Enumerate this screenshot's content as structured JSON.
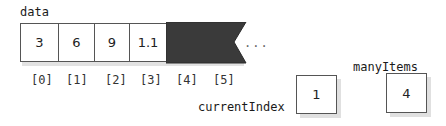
{
  "array": {
    "name": "data",
    "cells": [
      {
        "value": "3",
        "index_label": "[0]"
      },
      {
        "value": "6",
        "index_label": "[1]"
      },
      {
        "value": "9",
        "index_label": "[2]"
      },
      {
        "value": "1.1",
        "index_label": "[3]"
      },
      {
        "value": "",
        "index_label": "[4]"
      },
      {
        "value": "",
        "index_label": "[5]"
      }
    ],
    "continuation": "...",
    "unused_fill_color": "#3a3a3a"
  },
  "variables": {
    "current_index": {
      "name": "currentIndex",
      "value": "1"
    },
    "many_items": {
      "name": "manyItems",
      "value": "4"
    }
  }
}
